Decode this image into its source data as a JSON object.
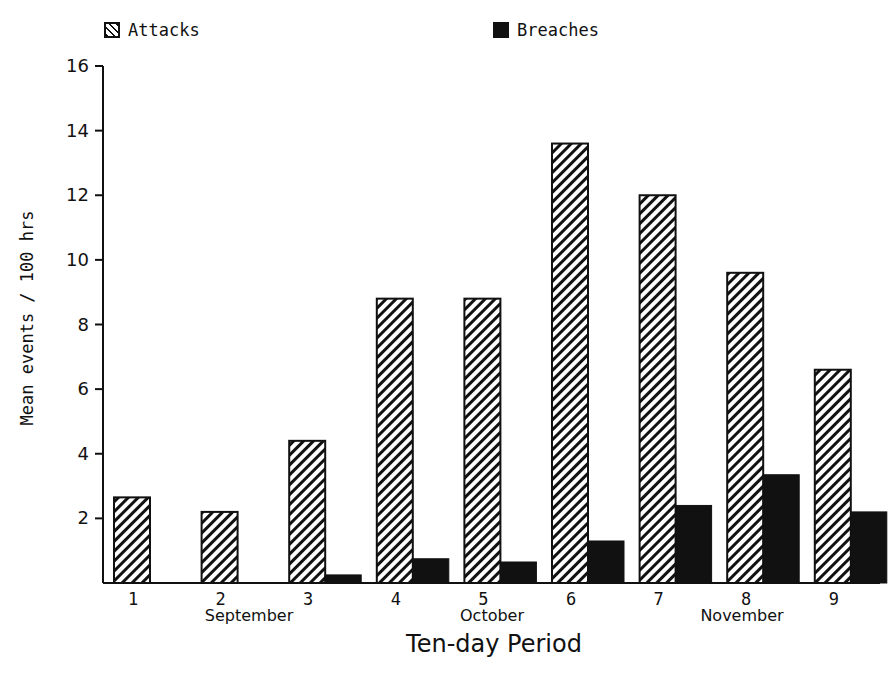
{
  "legend": {
    "attacks_label": "Attacks",
    "breaches_label": "Breaches"
  },
  "axes": {
    "ylabel": "Mean events / 100 hrs",
    "xlabel": "Ten-day Period",
    "months": [
      "September",
      "October",
      "November"
    ]
  },
  "chart_data": {
    "type": "bar",
    "title": "",
    "xlabel": "Ten-day Period",
    "ylabel": "Mean events / 100 hrs",
    "categories": [
      "1",
      "2",
      "3",
      "4",
      "5",
      "6",
      "7",
      "8",
      "9"
    ],
    "category_groups": [
      {
        "label": "September",
        "periods": [
          "1",
          "2",
          "3"
        ]
      },
      {
        "label": "October",
        "periods": [
          "4",
          "5",
          "6"
        ]
      },
      {
        "label": "November",
        "periods": [
          "7",
          "8",
          "9"
        ]
      }
    ],
    "series": [
      {
        "name": "Attacks",
        "pattern": "diagonal-hatch",
        "values": [
          2.65,
          2.2,
          4.4,
          8.8,
          8.8,
          13.6,
          12.0,
          9.6,
          6.6
        ]
      },
      {
        "name": "Breaches",
        "pattern": "solid-black",
        "values": [
          0,
          0,
          0.25,
          0.75,
          0.65,
          1.3,
          2.4,
          3.35,
          2.2
        ]
      }
    ],
    "ylim": [
      0,
      16
    ],
    "yticks": [
      2,
      4,
      6,
      8,
      10,
      12,
      14,
      16
    ],
    "grid": false,
    "legend_position": "top"
  },
  "colors": {
    "ink": "#111111",
    "background": "#ffffff"
  }
}
